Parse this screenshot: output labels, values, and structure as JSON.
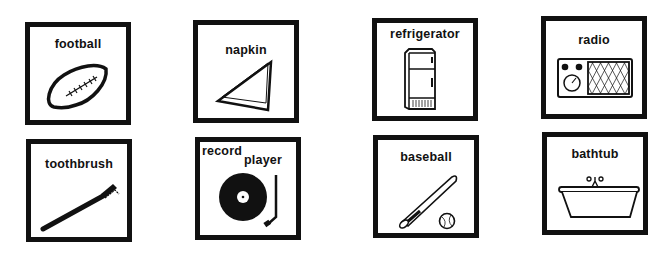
{
  "cards": [
    {
      "label": "football",
      "icon": "football-icon"
    },
    {
      "label": "napkin",
      "icon": "napkin-icon"
    },
    {
      "label": "refrigerator",
      "icon": "refrigerator-icon"
    },
    {
      "label": "radio",
      "icon": "radio-icon"
    },
    {
      "label": "toothbrush",
      "icon": "toothbrush-icon"
    },
    {
      "label_line1": "record",
      "label_line2": "player",
      "icon": "record-player-icon"
    },
    {
      "label": "baseball",
      "icon": "baseball-icon"
    },
    {
      "label": "bathtub",
      "icon": "bathtub-icon"
    }
  ]
}
